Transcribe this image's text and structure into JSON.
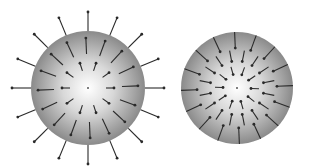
{
  "figure": {
    "background": "#ffffff",
    "sphere_colors": {
      "center": "#ffffff",
      "mid": "#d8d8d8",
      "edge": "#8a8a8a"
    },
    "arrow_color": "#2a2a2a",
    "panels": [
      {
        "name": "diverging-field-sphere",
        "direction": "outward",
        "cx": 88,
        "cy": 88,
        "r": 57,
        "outer_arrows": 16,
        "inner_rings": [
          {
            "count": 16,
            "r_from": 34,
            "r_to": 50
          },
          {
            "count": 10,
            "r_from": 18,
            "r_to": 26
          }
        ],
        "outer_ring": {
          "count": 16,
          "r_from": 57,
          "r_to": 76
        }
      },
      {
        "name": "converging-field-sphere",
        "direction": "inward",
        "cx": 237,
        "cy": 88,
        "r": 56,
        "inner_rings": [
          {
            "count": 16,
            "r_from": 56,
            "r_to": 40
          },
          {
            "count": 16,
            "r_from": 38,
            "r_to": 27
          },
          {
            "count": 10,
            "r_from": 22,
            "r_to": 14
          }
        ]
      }
    ]
  }
}
